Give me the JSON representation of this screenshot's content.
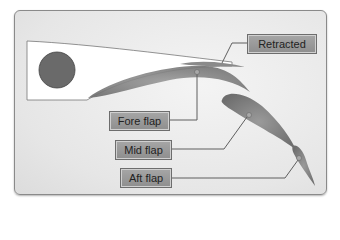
{
  "diagram": {
    "labels": {
      "retracted": "Retracted",
      "fore_flap": "Fore flap",
      "mid_flap": "Mid flap",
      "aft_flap": "Aft flap"
    },
    "colors": {
      "wing": "#ffffff",
      "spar": "#6a6a6a",
      "flap": "#7d7d7d",
      "label_bg": "#9a9a9a",
      "leader_line": "#5f5f5f"
    }
  }
}
